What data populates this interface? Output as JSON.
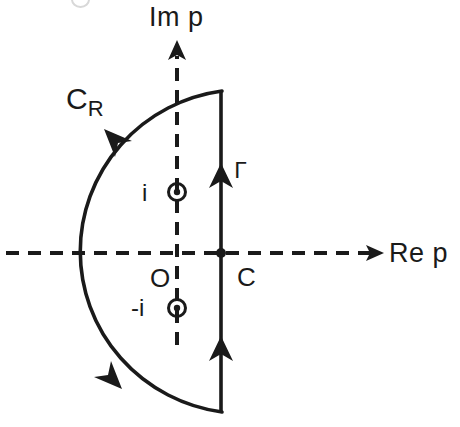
{
  "figure": {
    "background_color": "#ffffff",
    "line_color": "#1a1a1a",
    "width": 460,
    "height": 427
  },
  "axes": {
    "imaginary": {
      "label": "Im p",
      "style": "dashed",
      "orientation": "vertical",
      "x": 177,
      "y_top": 43,
      "y_bottom": 345,
      "arrow": "up"
    },
    "real": {
      "label": "Re p",
      "style": "dashed",
      "orientation": "horizontal",
      "y": 253,
      "x_left": 6,
      "x_right": 382,
      "arrow": "right"
    }
  },
  "contour": {
    "arc": {
      "label": "C",
      "subscript": "R",
      "center_x": 221,
      "center_y": 253,
      "radius": 163,
      "style": "solid",
      "direction": "clockwise-from-top",
      "arrowheads": 2
    },
    "vertical_line": {
      "label": "Γ",
      "x": 221,
      "y_top": 91,
      "y_bottom": 412,
      "style": "solid",
      "direction": "upward",
      "arrowheads": 2
    }
  },
  "points": [
    {
      "name": "pole-upper",
      "label": "i",
      "marker": "circled-dot",
      "x": 177,
      "y": 192
    },
    {
      "name": "pole-lower",
      "label": "-i",
      "marker": "circled-dot",
      "x": 177,
      "y": 308
    },
    {
      "name": "origin",
      "label": "O",
      "marker": "none",
      "x": 177,
      "y": 253
    },
    {
      "name": "abscissa",
      "label": "C",
      "marker": "filled-dot",
      "x": 221,
      "y": 253
    }
  ]
}
